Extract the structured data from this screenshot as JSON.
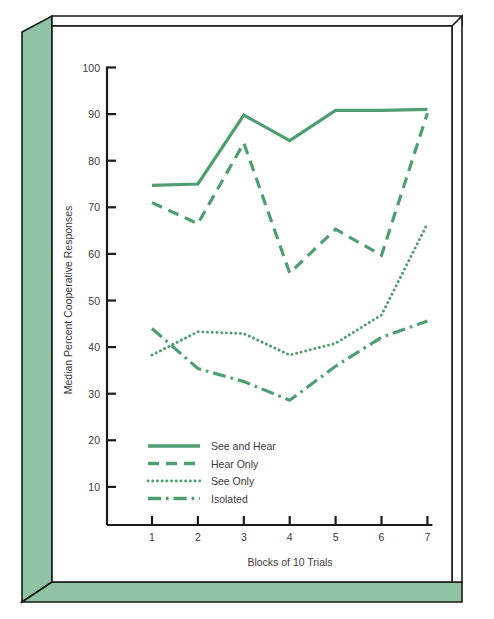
{
  "figure": {
    "background_color": "#ffffff",
    "frame_color": "#8fc3a4",
    "frame_edge_color": "#1b1b1b",
    "series_color": "#4f9e71",
    "text_color": "#3b3b3b"
  },
  "chart_data": {
    "type": "line",
    "title": "",
    "xlabel": "Blocks of 10 Trials",
    "ylabel": "Median Percent Cooperative Responses",
    "x": [
      1,
      2,
      3,
      4,
      5,
      6,
      7
    ],
    "xticklabels": [
      "1",
      "2",
      "3",
      "4",
      "5",
      "6",
      "7"
    ],
    "yticks": [
      10,
      20,
      30,
      40,
      50,
      60,
      70,
      80,
      90,
      100
    ],
    "yticklabels": [
      "10",
      "20",
      "30",
      "40",
      "50",
      "60",
      "70",
      "80",
      "90",
      "100"
    ],
    "xlim": [
      0.55,
      7.45
    ],
    "ylim": [
      3,
      103
    ],
    "grid": false,
    "legend_position": "lower-left-inside",
    "series": [
      {
        "name": "See and Hear",
        "linestyle": "solid",
        "values": [
          74.7,
          75.0,
          89.8,
          84.3,
          90.8,
          90.8,
          91.0
        ]
      },
      {
        "name": "Hear Only",
        "linestyle": "dashed",
        "values": [
          71.0,
          66.5,
          83.8,
          55.9,
          65.3,
          59.7,
          90.2
        ]
      },
      {
        "name": "See Only",
        "linestyle": "dotted",
        "values": [
          38.3,
          43.3,
          42.9,
          38.3,
          40.8,
          46.9,
          66.5
        ]
      },
      {
        "name": "Isolated",
        "linestyle": "dashdot",
        "values": [
          44.0,
          35.4,
          32.6,
          28.6,
          35.9,
          42.1,
          45.6
        ]
      }
    ]
  },
  "legend": {
    "entries": [
      {
        "label": "See and Hear",
        "style": "solid"
      },
      {
        "label": "Hear Only",
        "style": "dashed"
      },
      {
        "label": "See Only",
        "style": "dotted"
      },
      {
        "label": "Isolated",
        "style": "dashdot"
      }
    ]
  }
}
